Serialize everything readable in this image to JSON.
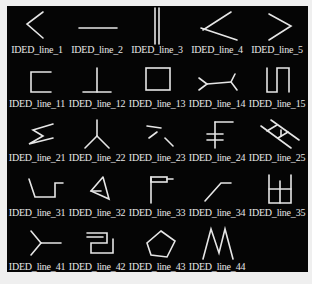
{
  "figure": {
    "background": "#050505",
    "items": [
      {
        "label": "IDED_line_1",
        "icon": "zigzag-left-open"
      },
      {
        "label": "IDED_line_2",
        "icon": "horizontal-line"
      },
      {
        "label": "IDED_line_3",
        "icon": "double-vertical-line"
      },
      {
        "label": "IDED_line_4",
        "icon": "crossed-lines"
      },
      {
        "label": "IDED_line_5",
        "icon": "chevron-right"
      },
      {
        "label": "IDED_line_11",
        "icon": "bracket-open-right"
      },
      {
        "label": "IDED_line_12",
        "icon": "inverted-t"
      },
      {
        "label": "IDED_line_13",
        "icon": "rectangle"
      },
      {
        "label": "IDED_line_14",
        "icon": "double-fork"
      },
      {
        "label": "IDED_line_15",
        "icon": "square-wave"
      },
      {
        "label": "IDED_line_21",
        "icon": "sigma-zigzag"
      },
      {
        "label": "IDED_line_22",
        "icon": "y-junction"
      },
      {
        "label": "IDED_line_23",
        "icon": "scattered-strokes"
      },
      {
        "label": "IDED_line_24",
        "icon": "stacked-bars"
      },
      {
        "label": "IDED_line_25",
        "icon": "ladder"
      },
      {
        "label": "IDED_line_31",
        "icon": "step-notch"
      },
      {
        "label": "IDED_line_32",
        "icon": "arrowhead"
      },
      {
        "label": "IDED_line_33",
        "icon": "flag"
      },
      {
        "label": "IDED_line_34",
        "icon": "bent-line"
      },
      {
        "label": "IDED_line_35",
        "icon": "window-grid"
      },
      {
        "label": "IDED_line_41",
        "icon": "fork-left"
      },
      {
        "label": "IDED_line_42",
        "icon": "nested-brackets"
      },
      {
        "label": "IDED_line_43",
        "icon": "pentagon"
      },
      {
        "label": "IDED_line_44",
        "icon": "m-shape"
      }
    ]
  }
}
